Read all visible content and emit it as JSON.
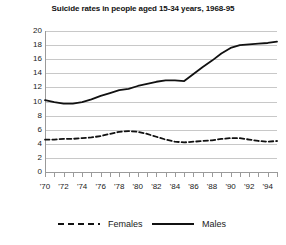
{
  "chart_data": {
    "type": "line",
    "title": "Suicide rates in people aged 15-34 years, 1968-95",
    "xlabel": "",
    "ylabel": "",
    "ylim": [
      0,
      20
    ],
    "ytick_step": 2,
    "yticks": [
      "20",
      "18",
      "16",
      "14",
      "12",
      "10",
      "8",
      "6",
      "4",
      "2",
      "0"
    ],
    "xlim": [
      1970,
      1995
    ],
    "xtick_labels": [
      "'70",
      "'72",
      "'74",
      "'76",
      "'78",
      "'80",
      "'82",
      "'84",
      "'86",
      "'88",
      "'90",
      "'92",
      "'94"
    ],
    "xtick_years": [
      1970,
      1972,
      1974,
      1976,
      1978,
      1980,
      1982,
      1984,
      1986,
      1988,
      1990,
      1992,
      1994
    ],
    "x": [
      1970,
      1971,
      1972,
      1973,
      1974,
      1975,
      1976,
      1977,
      1978,
      1979,
      1980,
      1981,
      1982,
      1983,
      1984,
      1985,
      1986,
      1987,
      1988,
      1989,
      1990,
      1991,
      1992,
      1993,
      1994,
      1995
    ],
    "grid": true,
    "legend_position": "bottom",
    "series": [
      {
        "name": "Males",
        "style": "solid",
        "color": "#111111",
        "values": [
          10.2,
          9.9,
          9.7,
          9.7,
          9.9,
          10.3,
          10.8,
          11.2,
          11.6,
          11.8,
          12.2,
          12.5,
          12.8,
          13.0,
          13.0,
          12.9,
          13.9,
          14.9,
          15.8,
          16.8,
          17.6,
          18.0,
          18.1,
          18.2,
          18.3,
          18.5
        ]
      },
      {
        "name": "Females",
        "style": "dashed",
        "color": "#111111",
        "values": [
          4.6,
          4.6,
          4.7,
          4.7,
          4.8,
          4.9,
          5.1,
          5.4,
          5.7,
          5.8,
          5.7,
          5.4,
          5.0,
          4.6,
          4.3,
          4.2,
          4.3,
          4.4,
          4.5,
          4.7,
          4.8,
          4.8,
          4.6,
          4.4,
          4.3,
          4.4
        ]
      }
    ]
  },
  "legend": {
    "females_label": "Females",
    "males_label": "Males"
  }
}
